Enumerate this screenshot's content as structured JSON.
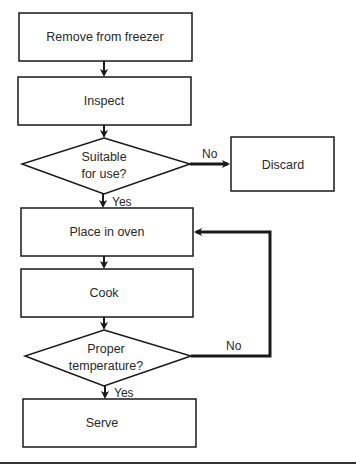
{
  "diagram": {
    "type": "flowchart",
    "colors": {
      "stroke": "#1a1a1a",
      "text": "#2a2a2a",
      "background": "#ffffff"
    },
    "nodes": [
      {
        "id": "remove",
        "shape": "process",
        "label": "Remove from freezer"
      },
      {
        "id": "inspect",
        "shape": "process",
        "label": "Inspect"
      },
      {
        "id": "suitable",
        "shape": "decision",
        "line1": "Suitable",
        "line2": "for use?"
      },
      {
        "id": "discard",
        "shape": "process",
        "label": "Discard"
      },
      {
        "id": "oven",
        "shape": "process",
        "label": "Place in oven"
      },
      {
        "id": "cook",
        "shape": "process",
        "label": "Cook"
      },
      {
        "id": "temp",
        "shape": "decision",
        "line1": "Proper",
        "line2": "temperature?"
      },
      {
        "id": "serve",
        "shape": "process",
        "label": "Serve"
      }
    ],
    "edges": [
      {
        "from": "remove",
        "to": "inspect",
        "label": ""
      },
      {
        "from": "inspect",
        "to": "suitable",
        "label": ""
      },
      {
        "from": "suitable",
        "to": "discard",
        "label": "No"
      },
      {
        "from": "suitable",
        "to": "oven",
        "label": "Yes"
      },
      {
        "from": "oven",
        "to": "cook",
        "label": ""
      },
      {
        "from": "cook",
        "to": "temp",
        "label": ""
      },
      {
        "from": "temp",
        "to": "oven",
        "label": "No"
      },
      {
        "from": "temp",
        "to": "serve",
        "label": "Yes"
      }
    ]
  }
}
